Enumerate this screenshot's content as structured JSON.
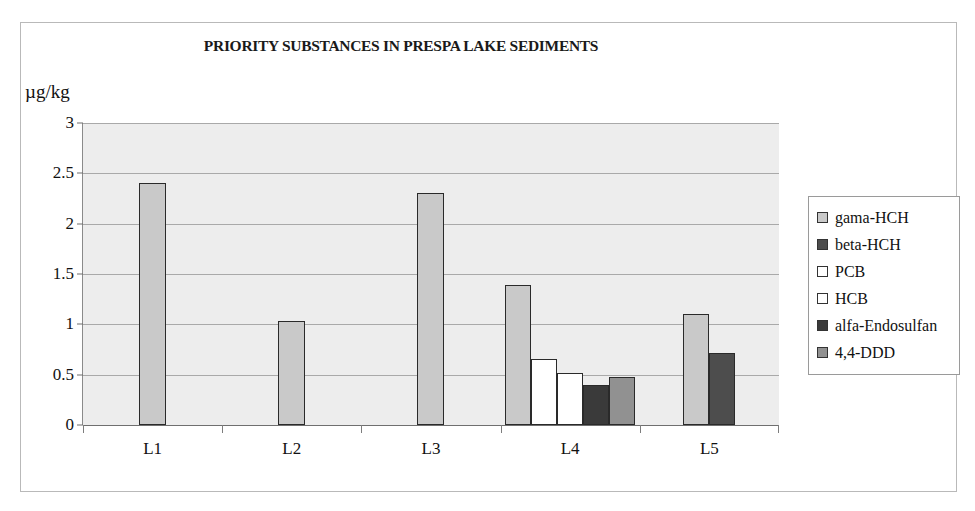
{
  "chart_data": {
    "type": "bar",
    "title": "PRIORITY SUBSTANCES IN PRESPA LAKE SEDIMENTS",
    "xlabel": "",
    "ylabel": "µg/kg",
    "ylim": [
      0,
      3
    ],
    "ytick_labels": [
      "0",
      "0.5",
      "1",
      "1.5",
      "2",
      "2.5",
      "3"
    ],
    "ytick_values": [
      0,
      0.5,
      1,
      1.5,
      2,
      2.5,
      3
    ],
    "grid": true,
    "legend_position": "right",
    "categories": [
      "L1",
      "L2",
      "L3",
      "L4",
      "L5"
    ],
    "series": [
      {
        "name": "gama-HCH",
        "color": "#c9c9c9",
        "values": [
          2.4,
          1.03,
          2.3,
          1.39,
          1.1
        ]
      },
      {
        "name": "beta-HCH",
        "color": "#4d4d4d",
        "values": [
          null,
          null,
          null,
          null,
          0.72
        ]
      },
      {
        "name": "PCB",
        "color": "#ffffff",
        "values": [
          null,
          null,
          null,
          0.66,
          null
        ]
      },
      {
        "name": "HCB",
        "color": "#ffffff",
        "values": [
          null,
          null,
          null,
          0.52,
          null
        ]
      },
      {
        "name": "alfa-Endosulfan",
        "color": "#3a3a3a",
        "values": [
          null,
          null,
          null,
          0.4,
          null
        ]
      },
      {
        "name": "4,4-DDD",
        "color": "#919191",
        "values": [
          null,
          null,
          null,
          0.48,
          null
        ]
      }
    ]
  },
  "legend": {
    "items": [
      {
        "label": "gama-HCH",
        "color": "#c9c9c9"
      },
      {
        "label": "beta-HCH",
        "color": "#4d4d4d"
      },
      {
        "label": "PCB",
        "color": "#ffffff"
      },
      {
        "label": "HCB",
        "color": "#ffffff"
      },
      {
        "label": "alfa-Endosulfan",
        "color": "#3a3a3a"
      },
      {
        "label": "4,4-DDD",
        "color": "#919191"
      }
    ]
  },
  "colors": {
    "plot_background": "#ededed",
    "gridline": "#a9a9a9",
    "axis": "#6f6f6f",
    "bar_outline": "#2a2a2a",
    "frame_border": "#b9b9b9"
  }
}
